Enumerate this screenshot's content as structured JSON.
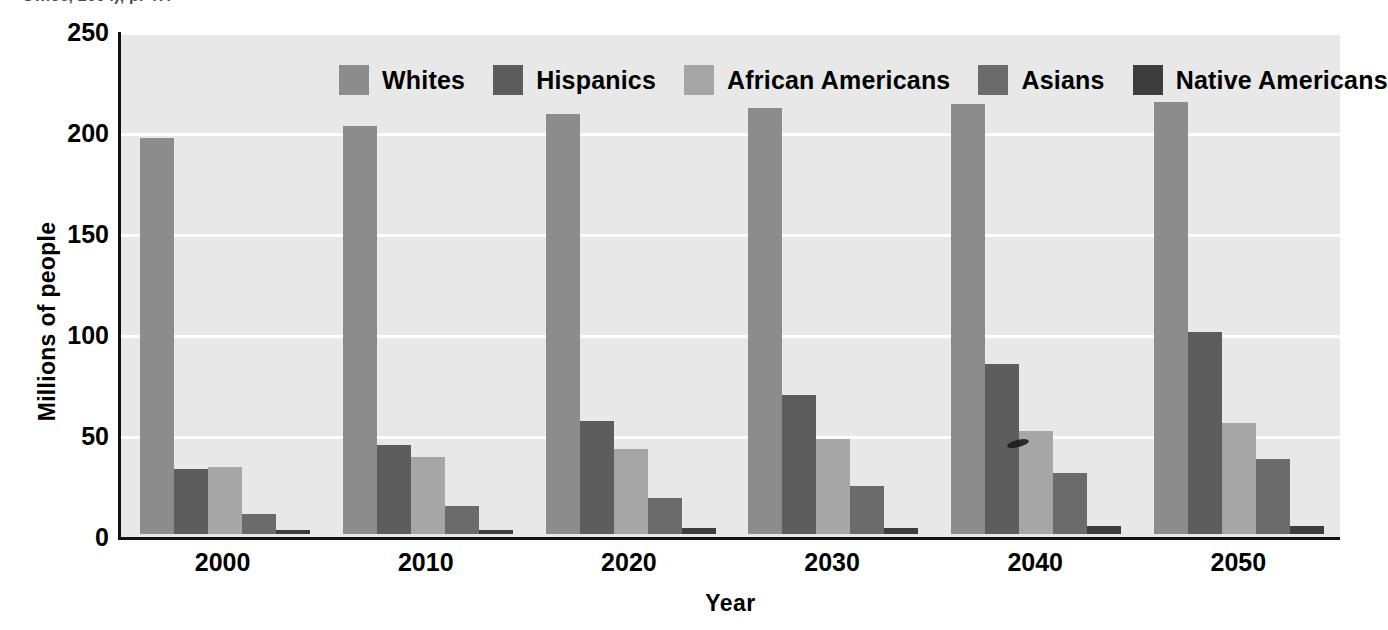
{
  "citation": {
    "text": "Office, 2004), p. 47."
  },
  "chart_data": {
    "type": "bar",
    "title": "",
    "xlabel": "Year",
    "ylabel": "Millions of people",
    "categories": [
      "2000",
      "2010",
      "2020",
      "2030",
      "2040",
      "2050"
    ],
    "yticks": [
      250,
      200,
      150,
      100,
      50,
      0
    ],
    "ylim": [
      0,
      250
    ],
    "grid": true,
    "legend_position": "top-center",
    "plot_background": "#e8e8e8",
    "series": [
      {
        "name": "Whites",
        "color": "#8c8c8c",
        "values": [
          196,
          202,
          208,
          211,
          213,
          214
        ]
      },
      {
        "name": "Hispanics",
        "color": "#5d5d5d",
        "values": [
          32,
          44,
          56,
          69,
          84,
          100
        ]
      },
      {
        "name": "African Americans",
        "color": "#a6a6a6",
        "values": [
          33,
          38,
          42,
          47,
          51,
          55
        ]
      },
      {
        "name": "Asians",
        "color": "#6b6b6b",
        "values": [
          10,
          14,
          18,
          24,
          30,
          37
        ]
      },
      {
        "name": "Native Americans",
        "color": "#3d3d3d",
        "values": [
          2,
          2,
          3,
          3,
          4,
          4
        ]
      }
    ]
  }
}
